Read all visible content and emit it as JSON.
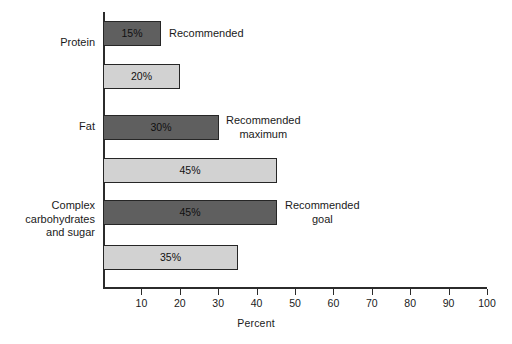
{
  "chart_data": {
    "type": "bar",
    "orientation": "horizontal",
    "title": "",
    "xlabel": "Percent",
    "ylabel": "",
    "xlim": [
      0,
      100
    ],
    "xticks": [
      10,
      20,
      30,
      40,
      50,
      60,
      70,
      80,
      90,
      100
    ],
    "grid": false,
    "legend": "annotations",
    "categories": [
      "Protein",
      "Fat",
      "Complex\ncarbohydrates\nand sugar"
    ],
    "series": [
      {
        "name": "Recommended",
        "values": [
          15,
          30,
          45
        ]
      },
      {
        "name": "Current",
        "values": [
          20,
          45,
          35
        ]
      }
    ],
    "bars": [
      {
        "value": 15,
        "label": "15%",
        "shade": "dark",
        "category": "Protein"
      },
      {
        "value": 20,
        "label": "20%",
        "shade": "light",
        "category": "Protein"
      },
      {
        "value": 30,
        "label": "30%",
        "shade": "dark",
        "category": "Fat"
      },
      {
        "value": 45,
        "label": "45%",
        "shade": "light",
        "category": "Fat"
      },
      {
        "value": 45,
        "label": "45%",
        "shade": "dark",
        "category": "Complex carbohydrates and sugar"
      },
      {
        "value": 35,
        "label": "35%",
        "shade": "light",
        "category": "Complex carbohydrates and sugar"
      }
    ],
    "annotations": [
      {
        "text": "Recommended",
        "attached_to_bar": 0,
        "align": "left"
      },
      {
        "text": "Recommended\nmaximum",
        "attached_to_bar": 2,
        "align": "center"
      },
      {
        "text": "Recommended\ngoal",
        "attached_to_bar": 4,
        "align": "center"
      }
    ],
    "colors": {
      "dark_bar": "#5f5f5f",
      "light_bar": "#d2d2d2",
      "bar_outline": "#262626",
      "axis": "#2b2b2b",
      "text": "#1a1a1a",
      "background": "#ffffff"
    }
  },
  "axis": {
    "x_title": "Percent",
    "tick_labels": [
      "10",
      "20",
      "30",
      "40",
      "50",
      "60",
      "70",
      "80",
      "90",
      "100"
    ]
  },
  "categories": {
    "protein": "Protein",
    "fat": "Fat",
    "carbs": "Complex\ncarbohydrates\nand sugar"
  },
  "bar_values": {
    "b0": "15%",
    "b1": "20%",
    "b2": "30%",
    "b3": "45%",
    "b4": "45%",
    "b5": "35%"
  },
  "annotations": {
    "a0": "Recommended",
    "a1": "Recommended\nmaximum",
    "a2": "Recommended\ngoal"
  }
}
